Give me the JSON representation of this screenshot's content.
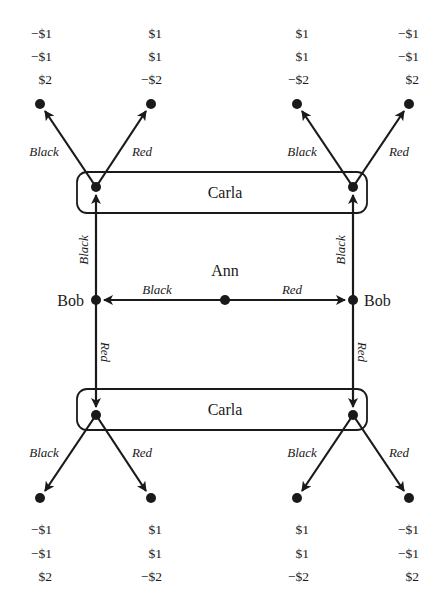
{
  "diagram": {
    "type": "extensive-form game tree",
    "root_player": "Ann",
    "players": {
      "ann": "Ann",
      "bob_left": "Bob",
      "bob_right": "Bob",
      "carla_top": "Carla",
      "carla_bottom": "Carla"
    },
    "ann_actions": {
      "left": "Black",
      "right": "Red"
    },
    "bob_actions": {
      "left_up": "Black",
      "left_down": "Red",
      "right_up": "Black",
      "right_down": "Red"
    },
    "carla_actions": {
      "top_left": {
        "black": "Black",
        "red": "Red"
      },
      "top_right": {
        "black": "Black",
        "red": "Red"
      },
      "bottom_left": {
        "black": "Black",
        "red": "Red"
      },
      "bottom_right": {
        "black": "Black",
        "red": "Red"
      }
    },
    "payoffs": {
      "top": [
        [
          "−$1",
          "−$1",
          "$2"
        ],
        [
          "$1",
          "$1",
          "−$2"
        ],
        [
          "$1",
          "$1",
          "−$2"
        ],
        [
          "−$1",
          "−$1",
          "$2"
        ]
      ],
      "bottom": [
        [
          "−$1",
          "−$1",
          "$2"
        ],
        [
          "$1",
          "$1",
          "−$2"
        ],
        [
          "$1",
          "$1",
          "−$2"
        ],
        [
          "−$1",
          "−$1",
          "$2"
        ]
      ]
    },
    "information_sets": [
      "Carla",
      "Carla"
    ]
  }
}
